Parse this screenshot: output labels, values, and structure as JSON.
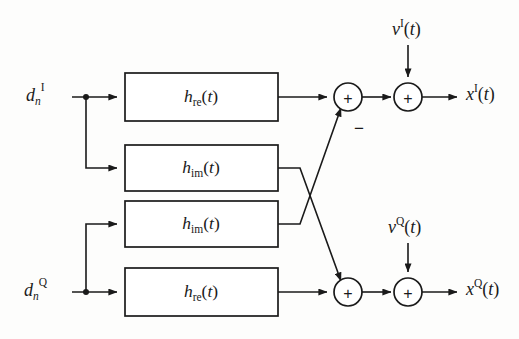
{
  "diagram": {
    "background_color": "#fdfdfc",
    "line_color": "#1a1a1a",
    "inputs": [
      {
        "id": "input-i",
        "base": "d",
        "subscript": "n",
        "superscript": "I",
        "full": "d_n^I"
      },
      {
        "id": "input-q",
        "base": "d",
        "subscript": "n",
        "superscript": "Q",
        "full": "d_n^Q"
      }
    ],
    "blocks": [
      {
        "id": "block-h-re-top",
        "base": "h",
        "subscript": "re",
        "arg": "(t)",
        "full": "h_re(t)"
      },
      {
        "id": "block-h-im-upper",
        "base": "h",
        "subscript": "im",
        "arg": "(t)",
        "full": "h_im(t)"
      },
      {
        "id": "block-h-im-lower",
        "base": "h",
        "subscript": "im",
        "arg": "(t)",
        "full": "h_im(t)"
      },
      {
        "id": "block-h-re-bottom",
        "base": "h",
        "subscript": "re",
        "arg": "(t)",
        "full": "h_re(t)"
      }
    ],
    "adders": [
      {
        "id": "adder-i-sum",
        "symbol": "+"
      },
      {
        "id": "adder-i-noise",
        "symbol": "+"
      },
      {
        "id": "adder-q-sum",
        "symbol": "+"
      },
      {
        "id": "adder-q-noise",
        "symbol": "+"
      }
    ],
    "signs": [
      {
        "id": "minus-sign-i",
        "symbol": "−"
      }
    ],
    "noise": [
      {
        "id": "noise-i",
        "base": "ν",
        "superscript": "I",
        "arg": "(t)",
        "full": "ν^I(t)"
      },
      {
        "id": "noise-q",
        "base": "ν",
        "superscript": "Q",
        "arg": "(t)",
        "full": "ν^Q(t)"
      }
    ],
    "outputs": [
      {
        "id": "output-i",
        "base": "x",
        "superscript": "I",
        "arg": "(t)",
        "full": "x^I(t)"
      },
      {
        "id": "output-q",
        "base": "x",
        "superscript": "Q",
        "arg": "(t)",
        "full": "x^Q(t)"
      }
    ]
  }
}
